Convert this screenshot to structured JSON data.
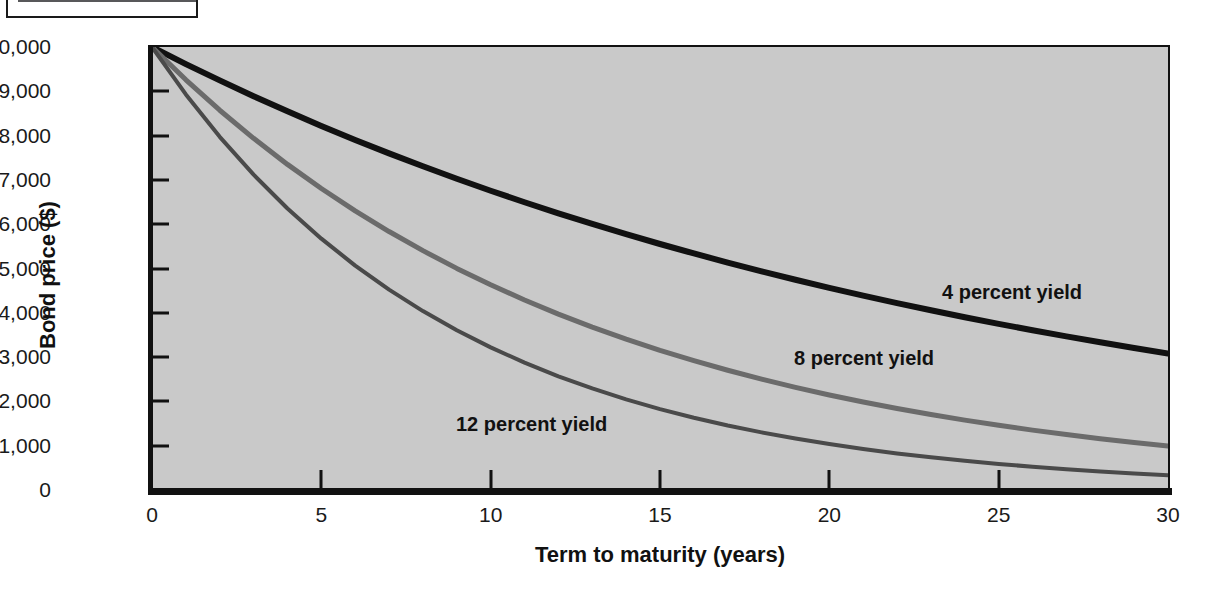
{
  "figure": {
    "badge_icon": "figure-number-banner",
    "title": ""
  },
  "chart_data": {
    "type": "line",
    "title": "",
    "xlabel": "Term to maturity (years)",
    "ylabel": "Bond price ($)",
    "xlim": [
      0,
      30
    ],
    "ylim": [
      0,
      10000
    ],
    "grid": false,
    "legend_position": "inline-annotations",
    "xticks": [
      "0",
      "5",
      "10",
      "15",
      "20",
      "25",
      "30"
    ],
    "xtick_values": [
      0,
      5,
      10,
      15,
      20,
      25,
      30
    ],
    "yticks": [
      "0",
      "1,000",
      "2,000",
      "3,000",
      "4,000",
      "5,000",
      "6,000",
      "7,000",
      "8,000",
      "9,000",
      "10,000"
    ],
    "ytick_values": [
      0,
      1000,
      2000,
      3000,
      4000,
      5000,
      6000,
      7000,
      8000,
      9000,
      10000
    ],
    "x": [
      0,
      1,
      2,
      3,
      4,
      5,
      6,
      7,
      8,
      9,
      10,
      11,
      12,
      13,
      14,
      15,
      16,
      17,
      18,
      19,
      20,
      21,
      22,
      23,
      24,
      25,
      26,
      27,
      28,
      29,
      30
    ],
    "series": [
      {
        "name": "4 percent yield",
        "label": "4 percent yield",
        "color": "#111111",
        "width": 6,
        "values": [
          10000,
          9615,
          9246,
          8890,
          8548,
          8219,
          7903,
          7599,
          7307,
          7026,
          6756,
          6496,
          6246,
          6006,
          5775,
          5553,
          5339,
          5134,
          4936,
          4746,
          4564,
          4388,
          4220,
          4057,
          3901,
          3751,
          3607,
          3468,
          3335,
          3207,
          3083
        ]
      },
      {
        "name": "8 percent yield",
        "label": "8 percent yield",
        "color": "#6b6b6b",
        "width": 5,
        "values": [
          10000,
          9259,
          8573,
          7938,
          7350,
          6806,
          6302,
          5835,
          5403,
          5002,
          4632,
          4289,
          3971,
          3677,
          3405,
          3152,
          2919,
          2703,
          2502,
          2317,
          2145,
          1987,
          1839,
          1703,
          1577,
          1460,
          1352,
          1252,
          1159,
          1073,
          994
        ]
      },
      {
        "name": "12 percent yield",
        "label": "12 percent yield",
        "color": "#4a4a4a",
        "width": 4,
        "values": [
          10000,
          8929,
          7972,
          7118,
          6355,
          5674,
          5066,
          4523,
          4039,
          3606,
          3220,
          2875,
          2567,
          2292,
          2046,
          1827,
          1631,
          1456,
          1300,
          1161,
          1037,
          926,
          826,
          738,
          659,
          588,
          525,
          469,
          419,
          374,
          334
        ]
      }
    ]
  },
  "colors": {
    "plot_background": "#c9c9c9",
    "axis": "#111111",
    "page_background": "#ffffff"
  }
}
